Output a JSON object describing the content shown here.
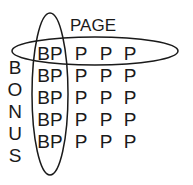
{
  "diagram": {
    "column_label": "PAGE",
    "row_label_letters": [
      "B",
      "O",
      "N",
      "U",
      "S"
    ],
    "rows": [
      [
        "BP",
        "P",
        "P",
        "P"
      ],
      [
        "BP",
        "P",
        "P",
        "P"
      ],
      [
        "BP",
        "P",
        "P",
        "P"
      ],
      [
        "BP",
        "P",
        "P",
        "P"
      ],
      [
        "BP",
        "P",
        "P",
        "P"
      ]
    ],
    "highlights": [
      "first-row-ellipse",
      "first-column-ellipse"
    ],
    "stroke_color": "#1a1a1a"
  }
}
